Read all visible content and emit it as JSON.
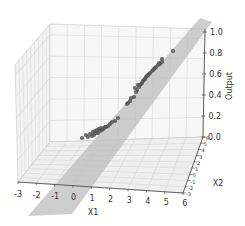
{
  "chart_data": {
    "type": "scatter",
    "subtype": "3d-scatter-with-regression-plane",
    "title": "",
    "xlabel": "X1",
    "ylabel": "X2",
    "zlabel": "Output",
    "x_ticks": [
      "-3",
      "-2",
      "-1",
      "0",
      "1",
      "2",
      "3",
      "4",
      "5",
      "6"
    ],
    "y_ticks": [
      "-3",
      "-2",
      "-1",
      "0",
      "1",
      "2",
      "3",
      "4",
      "5",
      "6"
    ],
    "z_ticks": [
      "0.0",
      "0.2",
      "0.4",
      "0.6",
      "0.8",
      "1.0"
    ],
    "xlim": [
      -3,
      6
    ],
    "ylim": [
      -3,
      6
    ],
    "zlim": [
      0,
      1.0
    ],
    "grid": true,
    "legend": null,
    "series": [
      {
        "name": "data points",
        "color": "#555555",
        "points_screen_approx": [
          [
            82,
            138
          ],
          [
            86,
            135
          ],
          [
            90,
            134
          ],
          [
            93,
            132
          ],
          [
            95,
            131
          ],
          [
            97,
            130
          ],
          [
            99,
            129
          ],
          [
            101,
            128
          ],
          [
            94,
            135
          ],
          [
            98,
            133
          ],
          [
            102,
            130
          ],
          [
            104,
            128
          ],
          [
            106,
            127
          ],
          [
            108,
            126
          ],
          [
            110,
            124
          ],
          [
            112,
            122
          ],
          [
            100,
            131
          ],
          [
            103,
            129
          ],
          [
            96,
            133
          ],
          [
            92,
            136
          ],
          [
            88,
            137
          ],
          [
            105,
            127
          ],
          [
            115,
            121
          ],
          [
            118,
            118
          ],
          [
            128,
            103
          ],
          [
            130,
            101
          ],
          [
            134,
            97
          ],
          [
            136,
            92
          ],
          [
            137,
            90
          ],
          [
            139,
            87
          ],
          [
            140,
            85
          ],
          [
            142,
            83
          ],
          [
            143,
            81
          ],
          [
            145,
            79
          ],
          [
            146,
            77
          ],
          [
            148,
            75
          ],
          [
            150,
            73
          ],
          [
            152,
            71
          ],
          [
            154,
            69
          ],
          [
            156,
            67
          ],
          [
            158,
            65
          ],
          [
            160,
            64
          ],
          [
            162,
            62
          ],
          [
            138,
            85
          ],
          [
            144,
            80
          ],
          [
            149,
            74
          ],
          [
            155,
            68
          ],
          [
            135,
            88
          ],
          [
            141,
            84
          ],
          [
            147,
            76
          ],
          [
            153,
            70
          ],
          [
            159,
            63
          ],
          [
            162,
            59
          ],
          [
            173,
            51
          ],
          [
            131,
            98
          ],
          [
            127,
            104
          ]
        ]
      }
    ],
    "plane": {
      "color": "#c8c8c8",
      "description": "fitted regression plane spanning diagonally from lower-left to upper-right"
    }
  }
}
